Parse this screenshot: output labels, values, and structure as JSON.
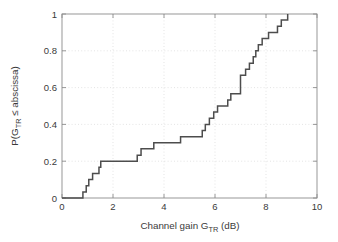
{
  "figure": {
    "background_color": "#ffffff",
    "axis_color": "#8c8c8c",
    "grid_color": "#d9d9d9",
    "curve_color": "#4d4d4d"
  },
  "axes": {
    "x_title_parts": {
      "prefix": "Channel gain G",
      "subscript": "TR",
      "suffix": " (dB)"
    },
    "y_title_parts": {
      "prefix": "P(G",
      "subscript": "TR",
      "suffix": " ≤ abscissa)"
    },
    "x_ticks": [
      "0",
      "2",
      "4",
      "6",
      "8",
      "10"
    ],
    "y_ticks": [
      "0",
      "0.2",
      "0.4",
      "0.6",
      "0.8",
      "1"
    ]
  },
  "chart_data": {
    "type": "line",
    "title": "",
    "xlabel": "Channel gain G_TR (dB)",
    "ylabel": "P(G_TR ≤ abscissa)",
    "xlim": [
      0,
      10
    ],
    "ylim": [
      0,
      1
    ],
    "xticks": [
      0,
      2,
      4,
      6,
      8,
      10
    ],
    "yticks": [
      0,
      0.2,
      0.4,
      0.6,
      0.8,
      1
    ],
    "grid": true,
    "legend": null,
    "drawstyle": "steps-post",
    "series": [
      {
        "name": "Empirical CDF of channel gain",
        "x": [
          0.0,
          0.82,
          0.95,
          1.05,
          1.2,
          1.45,
          1.52,
          2.85,
          2.95,
          3.1,
          3.6,
          4.65,
          5.3,
          5.5,
          5.62,
          5.78,
          5.95,
          6.1,
          6.5,
          6.62,
          7.0,
          7.1,
          7.2,
          7.35,
          7.5,
          7.6,
          7.7,
          7.85,
          8.1,
          8.45,
          8.6,
          8.85
        ],
        "y": [
          0.0,
          0.033,
          0.067,
          0.1,
          0.133,
          0.167,
          0.2,
          0.2,
          0.233,
          0.267,
          0.3,
          0.333,
          0.333,
          0.367,
          0.4,
          0.433,
          0.467,
          0.5,
          0.533,
          0.567,
          0.667,
          0.667,
          0.7,
          0.733,
          0.767,
          0.8,
          0.833,
          0.867,
          0.9,
          0.933,
          0.967,
          1.0
        ]
      }
    ]
  }
}
